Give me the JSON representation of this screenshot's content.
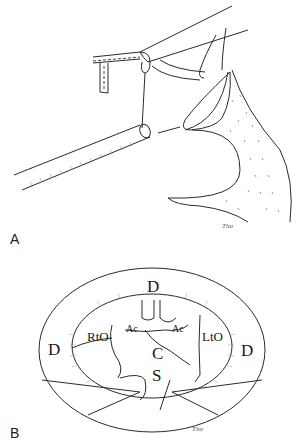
{
  "figure": {
    "panels": [
      {
        "id": "A",
        "label": "A",
        "description": "Surgical illustration of endoscope/tube approach to anatomical structure",
        "signature": "Tho"
      },
      {
        "id": "B",
        "label": "B",
        "description": "Endoscopic circular view with labeled anatomical landmarks",
        "signature": "Tho",
        "annotations": {
          "d_top": "D",
          "d_left": "D",
          "d_right": "D",
          "rto": "RtO",
          "lto": "LtO",
          "ac_left": "Ac",
          "ac_right": "Ac",
          "c": "C",
          "s": "S"
        }
      }
    ],
    "colors": {
      "line": "#2a2a2a",
      "hatch": "#777777",
      "background": "#ffffff"
    }
  }
}
